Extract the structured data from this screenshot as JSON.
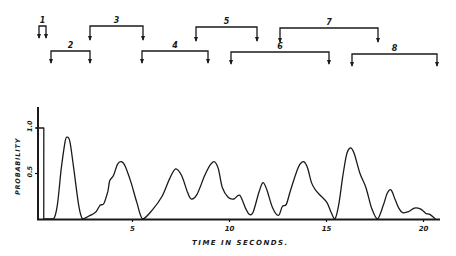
{
  "brackets": [
    {
      "label": "1",
      "x1": 39,
      "x2": 46,
      "y": 26,
      "arrow_end": 38
    },
    {
      "label": "2",
      "x1": 51,
      "x2": 90,
      "y": 51,
      "arrow_end": 63
    },
    {
      "label": "3",
      "x1": 90,
      "x2": 143,
      "y": 26,
      "arrow_end": 40
    },
    {
      "label": "4",
      "x1": 142,
      "x2": 208,
      "y": 51,
      "arrow_end": 63
    },
    {
      "label": "5",
      "x1": 196,
      "x2": 257,
      "y": 27,
      "arrow_end": 41
    },
    {
      "label": "6",
      "x1": 231,
      "x2": 329,
      "y": 52,
      "arrow_end": 64
    },
    {
      "label": "7",
      "x1": 280,
      "x2": 378,
      "y": 28,
      "arrow_end": 42
    },
    {
      "label": "8",
      "x1": 352,
      "x2": 437,
      "y": 54,
      "arrow_end": 66
    }
  ],
  "chart_data": {
    "type": "line",
    "title": "",
    "xlabel": "TIME IN SECONDS.",
    "ylabel": "PROBABILITY",
    "xlim": [
      0,
      20.8
    ],
    "ylim": [
      0,
      1.1
    ],
    "x_ticks": [
      5,
      10,
      15,
      20
    ],
    "x_tick_labels": [
      "5",
      "10",
      "15",
      "20"
    ],
    "y_ticks": [
      0.5,
      1.0
    ],
    "y_tick_labels": [
      "0.5",
      "1.0"
    ],
    "grid": false,
    "legend": null,
    "annotations": [
      "Segment brackets numbered 1-8 above plot"
    ],
    "series": [
      {
        "name": "probability",
        "x": [
          0.0,
          0.4,
          0.4,
          0.9,
          1.1,
          1.3,
          1.5,
          1.6,
          1.75,
          1.95,
          2.2,
          2.4,
          2.7,
          2.9,
          3.1,
          3.3,
          3.5,
          3.7,
          3.8,
          4.0,
          4.2,
          4.4,
          4.6,
          4.9,
          5.2,
          5.5,
          6.0,
          6.5,
          6.9,
          7.2,
          7.5,
          7.8,
          8.0,
          8.3,
          8.7,
          9.0,
          9.2,
          9.4,
          9.6,
          9.9,
          10.2,
          10.5,
          10.8,
          11.0,
          11.2,
          11.5,
          11.7,
          11.9,
          12.2,
          12.5,
          12.7,
          12.9,
          13.1,
          13.4,
          13.6,
          13.8,
          14.0,
          14.2,
          14.4,
          14.7,
          15.0,
          15.2,
          15.4,
          15.6,
          15.8,
          16.0,
          16.2,
          16.4,
          16.7,
          17.0,
          17.3,
          17.6,
          17.9,
          18.1,
          18.3,
          18.5,
          18.7,
          18.9,
          19.2,
          19.5,
          19.7,
          19.9,
          20.1,
          20.3,
          20.6
        ],
        "values": [
          1.0,
          1.0,
          0.0,
          0.0,
          0.15,
          0.55,
          0.85,
          0.9,
          0.85,
          0.55,
          0.15,
          0.0,
          0.03,
          0.05,
          0.08,
          0.15,
          0.17,
          0.3,
          0.42,
          0.48,
          0.6,
          0.63,
          0.58,
          0.4,
          0.18,
          0.0,
          0.1,
          0.25,
          0.45,
          0.55,
          0.48,
          0.3,
          0.22,
          0.27,
          0.48,
          0.6,
          0.63,
          0.55,
          0.35,
          0.24,
          0.22,
          0.26,
          0.12,
          0.05,
          0.08,
          0.3,
          0.4,
          0.32,
          0.12,
          0.04,
          0.14,
          0.16,
          0.3,
          0.5,
          0.6,
          0.63,
          0.56,
          0.4,
          0.32,
          0.25,
          0.18,
          0.08,
          0.0,
          0.15,
          0.45,
          0.7,
          0.78,
          0.72,
          0.5,
          0.35,
          0.12,
          0.0,
          0.15,
          0.28,
          0.32,
          0.22,
          0.12,
          0.07,
          0.08,
          0.12,
          0.12,
          0.1,
          0.06,
          0.05,
          0.0
        ]
      }
    ]
  }
}
